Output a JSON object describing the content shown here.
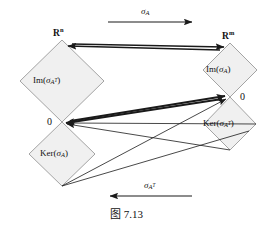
{
  "figure": {
    "caption": "图 7.13",
    "caption_number": "7.13",
    "background_color": "#ffffff",
    "diamond_fill": "#f0f0f0",
    "diamond_stroke": "#9a9a9a",
    "arrow_color": "#1a1a1a",
    "width": 273,
    "height": 232
  },
  "maps": {
    "forward": {
      "label_plain": "σ_A",
      "sigma": "σ",
      "sub": "A",
      "sup": "",
      "direction": "right"
    },
    "backward": {
      "label_plain": "σ_AT",
      "sigma": "σ",
      "sub": "A",
      "sup": "T",
      "direction": "left"
    }
  },
  "spaces": {
    "domain": {
      "symbol": "R",
      "exponent": "n",
      "label_plain": "R^n"
    },
    "codomain": {
      "symbol": "R",
      "exponent": "m",
      "label_plain": "R^m"
    }
  },
  "subspaces": {
    "im_at": {
      "kind": "Im",
      "sigma": "σ",
      "sub": "A",
      "sup": "T",
      "label_plain": "Im(σ_AT)"
    },
    "ker_a": {
      "kind": "Ker",
      "sigma": "σ",
      "sub": "A",
      "sup": "",
      "label_plain": "Ker(σ_A)"
    },
    "im_a": {
      "kind": "Im",
      "sigma": "σ",
      "sub": "A",
      "sup": "",
      "label_plain": "Im(σ_A)"
    },
    "ker_at": {
      "kind": "Ker",
      "sigma": "σ",
      "sub": "A",
      "sup": "T",
      "label_plain": "Ker(σ_AT)"
    }
  },
  "origins": {
    "left": "0",
    "right": "0"
  }
}
